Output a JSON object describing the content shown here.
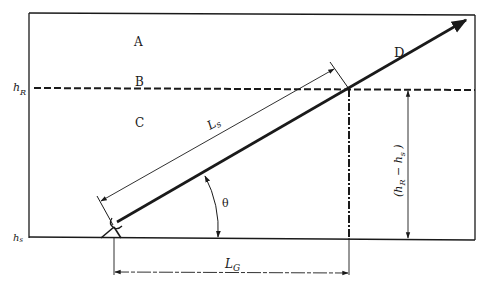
{
  "diagram": {
    "type": "geometry-sketch",
    "colors": {
      "line": "#1a1a1a",
      "background": "#ffffff"
    },
    "regions": {
      "A": "A",
      "B": "B",
      "C": "C",
      "D": "D"
    },
    "levels": {
      "h_R": {
        "base": "h",
        "sub": "R"
      },
      "h_s": {
        "base": "h",
        "sub": "s"
      }
    },
    "dimensions": {
      "L_s": {
        "base": "L",
        "sub": "s"
      },
      "L_G": {
        "base": "L",
        "sub": "G"
      },
      "height_diff": {
        "open": "(",
        "h1": "h",
        "sub1": "R",
        "minus": " − ",
        "h2": "h",
        "sub2": "s",
        "close": " )"
      }
    },
    "angle": {
      "symbol": "θ"
    }
  }
}
